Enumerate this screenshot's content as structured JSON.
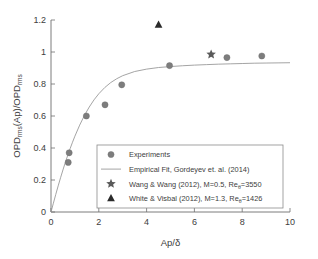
{
  "chart_data": {
    "type": "scatter",
    "title": "",
    "xlabel": "Ap/δ",
    "ylabel": "OPD_rms(Ap)/OPD_rms",
    "ylabel_main": "OPD",
    "ylabel_sub1": "rms",
    "ylabel_mid": "(Ap)/OPD",
    "ylabel_sub2": "rms",
    "xlim": [
      0,
      10
    ],
    "ylim": [
      0,
      1.2
    ],
    "xticks": [
      0,
      2,
      4,
      6,
      8,
      10
    ],
    "xtick_labels": [
      "0",
      "2",
      "4",
      "6",
      "8",
      "10"
    ],
    "yticks": [
      0,
      0.2,
      0.4,
      0.6,
      0.8,
      1.0,
      1.2
    ],
    "ytick_labels": [
      "0",
      "0.2",
      "0.4",
      "0.6",
      "0.8",
      "1",
      "1.2"
    ],
    "grid": false,
    "legend_position": "lower-center",
    "marker_color": "#7d7d7d",
    "line_color": "#9a9a9a",
    "axis_color": "#6e6e6e",
    "text_color": "#3d3d3d",
    "series": [
      {
        "name": "Experiments",
        "marker": "circle",
        "color": "#7d7d7d",
        "points": [
          {
            "x": 0.72,
            "y": 0.31
          },
          {
            "x": 0.76,
            "y": 0.37
          },
          {
            "x": 1.48,
            "y": 0.6
          },
          {
            "x": 2.26,
            "y": 0.67
          },
          {
            "x": 2.96,
            "y": 0.795
          },
          {
            "x": 4.96,
            "y": 0.915
          },
          {
            "x": 7.36,
            "y": 0.965
          },
          {
            "x": 8.82,
            "y": 0.975
          }
        ]
      },
      {
        "name": "Empirical Fit, Gordeyev et. al. (2014)",
        "marker": "line",
        "color": "#9a9a9a",
        "curve": [
          {
            "x": 0.0,
            "y": 0.0
          },
          {
            "x": 0.1,
            "y": 0.055
          },
          {
            "x": 0.2,
            "y": 0.11
          },
          {
            "x": 0.3,
            "y": 0.163
          },
          {
            "x": 0.4,
            "y": 0.214
          },
          {
            "x": 0.5,
            "y": 0.263
          },
          {
            "x": 0.6,
            "y": 0.31
          },
          {
            "x": 0.7,
            "y": 0.354
          },
          {
            "x": 0.8,
            "y": 0.396
          },
          {
            "x": 0.9,
            "y": 0.436
          },
          {
            "x": 1.0,
            "y": 0.474
          },
          {
            "x": 1.2,
            "y": 0.543
          },
          {
            "x": 1.4,
            "y": 0.604
          },
          {
            "x": 1.6,
            "y": 0.656
          },
          {
            "x": 1.8,
            "y": 0.701
          },
          {
            "x": 2.0,
            "y": 0.739
          },
          {
            "x": 2.25,
            "y": 0.778
          },
          {
            "x": 2.5,
            "y": 0.809
          },
          {
            "x": 2.75,
            "y": 0.833
          },
          {
            "x": 3.0,
            "y": 0.852
          },
          {
            "x": 3.5,
            "y": 0.878
          },
          {
            "x": 4.0,
            "y": 0.893
          },
          {
            "x": 4.5,
            "y": 0.903
          },
          {
            "x": 5.0,
            "y": 0.909
          },
          {
            "x": 5.5,
            "y": 0.914
          },
          {
            "x": 6.0,
            "y": 0.918
          },
          {
            "x": 6.5,
            "y": 0.921
          },
          {
            "x": 7.0,
            "y": 0.924
          },
          {
            "x": 7.5,
            "y": 0.926
          },
          {
            "x": 8.0,
            "y": 0.928
          },
          {
            "x": 8.5,
            "y": 0.93
          },
          {
            "x": 9.0,
            "y": 0.931
          },
          {
            "x": 9.5,
            "y": 0.932
          },
          {
            "x": 10.0,
            "y": 0.933
          }
        ]
      },
      {
        "name": "Wang & Wang (2012), M=0.5, Reθ=3550",
        "marker": "star",
        "color": "#5a5a5a",
        "points": [
          {
            "x": 6.7,
            "y": 0.985
          }
        ]
      },
      {
        "name": "White & Visbal (2012), M=1.3, Reθ=1426",
        "marker": "triangle",
        "color": "#2b2b2b",
        "points": [
          {
            "x": 4.5,
            "y": 1.17
          }
        ]
      }
    ]
  },
  "legend": {
    "items": [
      {
        "marker": "circle",
        "label": "Experiments",
        "label_pre": "Experiments",
        "label_sub": "",
        "label_post": ""
      },
      {
        "marker": "line",
        "label": "Empirical Fit, Gordeyev et. al. (2014)",
        "label_pre": "Empirical Fit, Gordeyev et. al. (2014)",
        "label_sub": "",
        "label_post": ""
      },
      {
        "marker": "star",
        "label": "Wang & Wang (2012), M=0.5, Reθ=3550",
        "label_pre": "Wang & Wang (2012), M=0.5, Re",
        "label_sub": "θ",
        "label_post": "=3550"
      },
      {
        "marker": "triangle",
        "label": "White & Visbal (2012), M=1.3, Reθ=1426",
        "label_pre": "White & Visbal (2012), M=1.3, Re",
        "label_sub": "θ",
        "label_post": "=1426"
      }
    ]
  },
  "axes": {
    "x_title": "Ap/δ",
    "y_title_part1": "OPD",
    "y_title_sub1": "rms",
    "y_title_part2": "(Ap)/OPD",
    "y_title_sub2": "rms"
  }
}
